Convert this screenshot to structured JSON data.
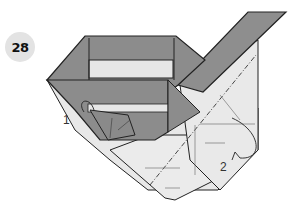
{
  "step": {
    "number": "28"
  },
  "labels": {
    "step1": "1",
    "step2": "2"
  },
  "colors": {
    "dark_fill": "#8c8c8c",
    "light_fill": "#e6e6e6",
    "stroke": "#222222"
  }
}
